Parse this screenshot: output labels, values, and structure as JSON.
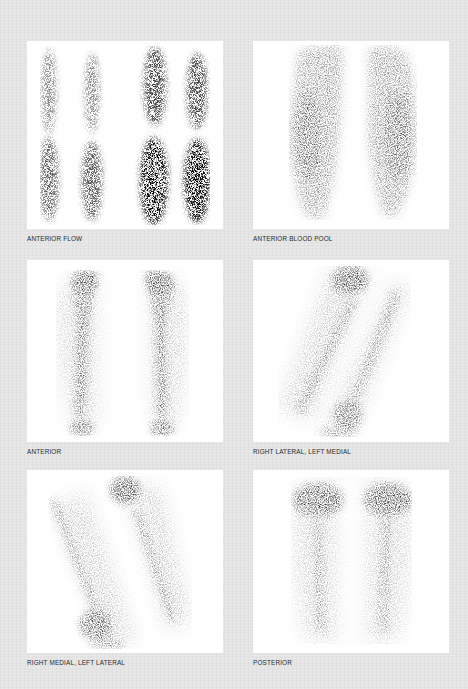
{
  "plate": {
    "background_color": "#e4e4e4",
    "panels": [
      {
        "id": "anterior-flow",
        "caption": "ANTERIOR FLOW"
      },
      {
        "id": "anterior-blood-pool",
        "caption": "ANTERIOR BLOOD POOL"
      },
      {
        "id": "anterior",
        "caption": "ANTERIOR"
      },
      {
        "id": "right-lateral-left-medial",
        "caption": "RIGHT LATERAL, LEFT MEDIAL"
      },
      {
        "id": "right-medial-left-lateral",
        "caption": "RIGHT MEDIAL, LEFT LATERAL"
      },
      {
        "id": "posterior",
        "caption": "POSTERIOR"
      }
    ]
  }
}
